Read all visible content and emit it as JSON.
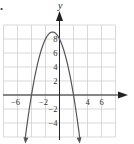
{
  "chart_data": {
    "type": "line",
    "title": "",
    "function": "y = -(x + 1)^2 + 9",
    "xlabel": "x",
    "ylabel": "y",
    "xlim": [
      -8,
      8
    ],
    "ylim": [
      -6,
      10
    ],
    "grid": true,
    "grid_step": 2,
    "x_tick_labels": [
      "-6",
      "-2",
      "4",
      "6"
    ],
    "x_ticks": [
      -6,
      -2,
      4,
      6
    ],
    "y_tick_labels": [
      "8",
      "6",
      "4",
      "2",
      "-2",
      "-4"
    ],
    "y_ticks": [
      8,
      6,
      4,
      2,
      -2,
      -4
    ],
    "vertex": [
      -1,
      9
    ],
    "x_intercepts": [
      -4,
      2
    ],
    "y_intercept": 8,
    "series": [
      {
        "name": "parabola",
        "x": [
          -4.9,
          -4,
          -3,
          -2,
          -1,
          0,
          1,
          2,
          2.9
        ],
        "y": [
          -6.2,
          0,
          5,
          8,
          9,
          8,
          5,
          0,
          -6.2
        ]
      }
    ],
    "colors": {
      "curve": "#555555",
      "grid": "#cfcfcf",
      "axis": "#222222"
    }
  },
  "labels": {
    "y_axis": "y",
    "bullet": "."
  }
}
